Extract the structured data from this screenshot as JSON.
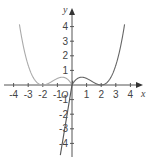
{
  "chart_data": {
    "type": "line",
    "title": "",
    "xlabel": "x",
    "ylabel": "y",
    "origin_label": "O",
    "xlim": [
      -4.6,
      4.6
    ],
    "ylim": [
      -4.8,
      5.0
    ],
    "x_ticks": [
      -4,
      -3,
      -2,
      -1,
      1,
      2,
      3,
      4
    ],
    "y_ticks": [
      -4,
      -3,
      -2,
      -1,
      1,
      2,
      3,
      4
    ],
    "grid": false,
    "series": [
      {
        "name": "curve-right",
        "color": "#666666",
        "description": "y = 0.45·x(x−2)² for x ≥ 0",
        "x": [
          0,
          0.67,
          1,
          1.5,
          2,
          2.5,
          3,
          3.3,
          3.6
        ],
        "y": [
          0,
          0.53,
          0.45,
          0.17,
          0,
          0.28,
          1.35,
          2.5,
          4.1
        ]
      },
      {
        "name": "curve-left-reflection",
        "color": "#aaaaaa",
        "description": "mirror of right curve across y-axis",
        "x": [
          0,
          -0.67,
          -1,
          -1.5,
          -2,
          -2.5,
          -3,
          -3.3,
          -3.6
        ],
        "y": [
          0,
          0.53,
          0.45,
          0.17,
          0,
          0.28,
          1.35,
          2.5,
          4.1
        ]
      },
      {
        "name": "line",
        "color": "#555555",
        "description": "steep line through origin",
        "x": [
          -0.8,
          0.05
        ],
        "y": [
          -4.8,
          0.3
        ]
      }
    ]
  }
}
